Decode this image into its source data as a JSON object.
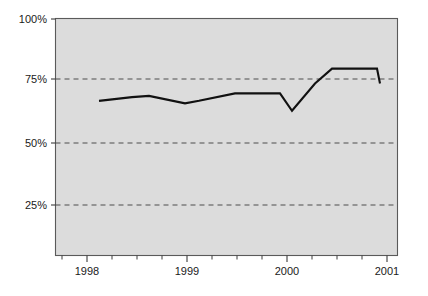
{
  "chart_data": {
    "type": "line",
    "title": "",
    "subtitle": "",
    "xlabel": "",
    "ylabel": "",
    "xlim": [
      1997.68,
      1998.1
    ],
    "ylim": [
      0,
      100
    ],
    "grid": true,
    "gridlines_y": [
      25,
      50,
      75
    ],
    "legend": null,
    "legend_position": "none",
    "y_ticks": [
      25,
      50,
      75,
      100
    ],
    "y_tick_labels": [
      "25%",
      "50%",
      "75%",
      "100%"
    ],
    "x_ticks": [
      1998,
      1999,
      2000,
      2001
    ],
    "x_tick_labels": [
      "1998",
      "1999",
      "2000",
      "2001"
    ],
    "x_minor_ticks_per_interval": 3,
    "series": [
      {
        "name": "value",
        "x": [
          1998.12,
          1998.45,
          1998.62,
          1998.98,
          1999.12,
          1999.48,
          1999.75,
          1999.93,
          2000.05,
          2000.28,
          2000.45,
          2000.9,
          2000.93
        ],
        "values": [
          67,
          68.5,
          69,
          66,
          67,
          70,
          70,
          70,
          63,
          74,
          80,
          80,
          74
        ]
      }
    ],
    "colors": {
      "line": "#111111",
      "plot_background": "#dcdcdc",
      "grid": "#4d4d4d",
      "axis": "#3c3c3c",
      "page_background": "#ffffff",
      "text": "#1a1a1a"
    },
    "annotations": []
  },
  "axes": {
    "y_labels": [
      {
        "text": "100%",
        "value": 100
      },
      {
        "text": "75%",
        "value": 75
      },
      {
        "text": "50%",
        "value": 50
      },
      {
        "text": "25%",
        "value": 25
      }
    ],
    "x_labels": [
      {
        "text": "1998",
        "value": 1998
      },
      {
        "text": "1999",
        "value": 1999
      },
      {
        "text": "2000",
        "value": 2000
      },
      {
        "text": "2001",
        "value": 2001
      }
    ]
  }
}
